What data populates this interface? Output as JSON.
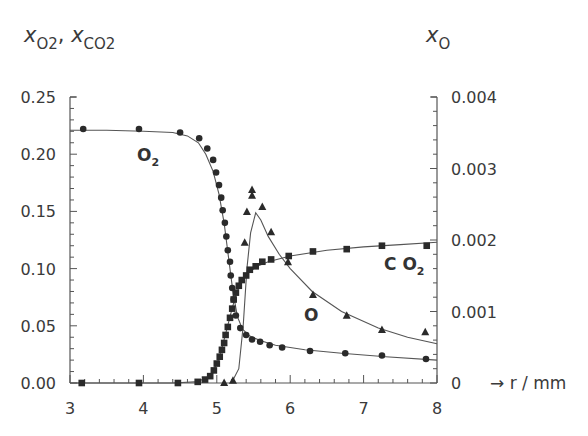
{
  "chart_data": {
    "type": "line",
    "title": "",
    "xlabel": "r / mm",
    "ylabel_left": "x_O2, x_CO2",
    "ylabel_right": "x_O",
    "xlim": [
      3,
      8
    ],
    "ylim_left": [
      0,
      0.25
    ],
    "ylim_right": [
      0,
      0.004
    ],
    "grid": false,
    "legend": "inline labels",
    "x_ticks": [
      "3",
      "4",
      "5",
      "6",
      "7",
      "8"
    ],
    "y_left_ticks": [
      "0.00",
      "0.05",
      "0.10",
      "0.15",
      "0.20",
      "0.25"
    ],
    "y_right_ticks": [
      "0",
      "0.001",
      "0.002",
      "0.003",
      "0.004"
    ],
    "annotations": [
      {
        "text": "O",
        "sub": "2",
        "series": "O2"
      },
      {
        "text": "C O",
        "sub": "2",
        "series": "CO2"
      },
      {
        "text": "O",
        "sub": "",
        "series": "O"
      }
    ],
    "series": [
      {
        "name": "O2",
        "axis": "left",
        "marker": "circle",
        "points": [
          [
            3.18,
            0.222
          ],
          [
            3.94,
            0.222
          ],
          [
            4.5,
            0.219
          ],
          [
            4.76,
            0.214
          ],
          [
            4.87,
            0.205
          ],
          [
            4.95,
            0.195
          ],
          [
            4.99,
            0.184
          ],
          [
            5.03,
            0.173
          ],
          [
            5.06,
            0.162
          ],
          [
            5.08,
            0.151
          ],
          [
            5.11,
            0.14
          ],
          [
            5.13,
            0.128
          ],
          [
            5.15,
            0.116
          ],
          [
            5.18,
            0.106
          ],
          [
            5.19,
            0.094
          ],
          [
            5.21,
            0.083
          ],
          [
            5.23,
            0.073
          ],
          [
            5.26,
            0.059
          ],
          [
            5.32,
            0.048
          ],
          [
            5.4,
            0.042
          ],
          [
            5.48,
            0.038
          ],
          [
            5.59,
            0.036
          ],
          [
            5.72,
            0.033
          ],
          [
            5.89,
            0.031
          ],
          [
            6.27,
            0.028
          ],
          [
            6.75,
            0.026
          ],
          [
            7.25,
            0.024
          ],
          [
            7.85,
            0.021
          ]
        ],
        "curve": [
          [
            3.0,
            0.221
          ],
          [
            3.5,
            0.221
          ],
          [
            4.0,
            0.22
          ],
          [
            4.4,
            0.219
          ],
          [
            4.6,
            0.216
          ],
          [
            4.75,
            0.21
          ],
          [
            4.85,
            0.2
          ],
          [
            4.95,
            0.185
          ],
          [
            5.03,
            0.165
          ],
          [
            5.1,
            0.14
          ],
          [
            5.16,
            0.11
          ],
          [
            5.22,
            0.08
          ],
          [
            5.28,
            0.058
          ],
          [
            5.35,
            0.047
          ],
          [
            5.45,
            0.041
          ],
          [
            5.6,
            0.037
          ],
          [
            5.8,
            0.033
          ],
          [
            6.2,
            0.029
          ],
          [
            6.7,
            0.026
          ],
          [
            7.3,
            0.023
          ],
          [
            8.0,
            0.02
          ]
        ]
      },
      {
        "name": "CO2",
        "axis": "left",
        "marker": "square",
        "points": [
          [
            3.16,
            0.0
          ],
          [
            3.94,
            0.0
          ],
          [
            4.47,
            0.0
          ],
          [
            4.74,
            0.001
          ],
          [
            4.84,
            0.003
          ],
          [
            4.91,
            0.006
          ],
          [
            4.96,
            0.011
          ],
          [
            5.0,
            0.017
          ],
          [
            5.04,
            0.023
          ],
          [
            5.07,
            0.029
          ],
          [
            5.1,
            0.035
          ],
          [
            5.12,
            0.042
          ],
          [
            5.15,
            0.049
          ],
          [
            5.18,
            0.057
          ],
          [
            5.21,
            0.065
          ],
          [
            5.23,
            0.073
          ],
          [
            5.26,
            0.079
          ],
          [
            5.3,
            0.085
          ],
          [
            5.34,
            0.09
          ],
          [
            5.4,
            0.094
          ],
          [
            5.45,
            0.099
          ],
          [
            5.53,
            0.102
          ],
          [
            5.62,
            0.106
          ],
          [
            5.74,
            0.108
          ],
          [
            5.98,
            0.111
          ],
          [
            6.31,
            0.115
          ],
          [
            6.77,
            0.117
          ],
          [
            7.25,
            0.12
          ],
          [
            7.86,
            0.12
          ]
        ],
        "curve": [
          [
            3.0,
            0.0
          ],
          [
            4.4,
            0.0
          ],
          [
            4.7,
            0.001
          ],
          [
            4.85,
            0.004
          ],
          [
            4.95,
            0.01
          ],
          [
            5.02,
            0.02
          ],
          [
            5.08,
            0.033
          ],
          [
            5.14,
            0.048
          ],
          [
            5.2,
            0.063
          ],
          [
            5.26,
            0.077
          ],
          [
            5.33,
            0.088
          ],
          [
            5.42,
            0.096
          ],
          [
            5.55,
            0.102
          ],
          [
            5.7,
            0.106
          ],
          [
            6.0,
            0.111
          ],
          [
            6.5,
            0.116
          ],
          [
            7.0,
            0.119
          ],
          [
            7.5,
            0.121
          ],
          [
            8.0,
            0.123
          ]
        ]
      },
      {
        "name": "O",
        "axis": "right",
        "marker": "triangle",
        "points": [
          [
            5.1,
            0.0
          ],
          [
            5.22,
            3e-05
          ],
          [
            5.38,
            0.00196
          ],
          [
            5.41,
            0.00239
          ],
          [
            5.48,
            0.0027
          ],
          [
            5.48,
            0.00262
          ],
          [
            5.62,
            0.00246
          ],
          [
            5.74,
            0.00211
          ],
          [
            5.97,
            0.00169
          ],
          [
            6.31,
            0.00123
          ],
          [
            6.77,
            0.00094
          ],
          [
            7.25,
            0.00074
          ],
          [
            7.84,
            0.00071
          ]
        ],
        "curve": [
          [
            5.2,
            0.0
          ],
          [
            5.3,
            0.0002
          ],
          [
            5.36,
            0.0008
          ],
          [
            5.41,
            0.0016
          ],
          [
            5.46,
            0.0021
          ],
          [
            5.53,
            0.00238
          ],
          [
            5.6,
            0.00228
          ],
          [
            5.7,
            0.00205
          ],
          [
            5.85,
            0.0018
          ],
          [
            6.0,
            0.0016
          ],
          [
            6.3,
            0.00128
          ],
          [
            6.7,
            0.001
          ],
          [
            7.2,
            0.00077
          ],
          [
            7.6,
            0.00064
          ],
          [
            8.0,
            0.00055
          ]
        ]
      }
    ]
  },
  "labels": {
    "y_left_title_x": "x",
    "y_left_title_sub1": "O2",
    "y_left_title_sep": ", ",
    "y_left_title_sub2": "CO2",
    "y_right_title_x": "x",
    "y_right_title_sub": "O",
    "x_title": "→ r / mm",
    "series_O2": "O",
    "series_O2_sub": "2",
    "series_CO2": "C O",
    "series_CO2_sub": "2",
    "series_O": "O"
  }
}
